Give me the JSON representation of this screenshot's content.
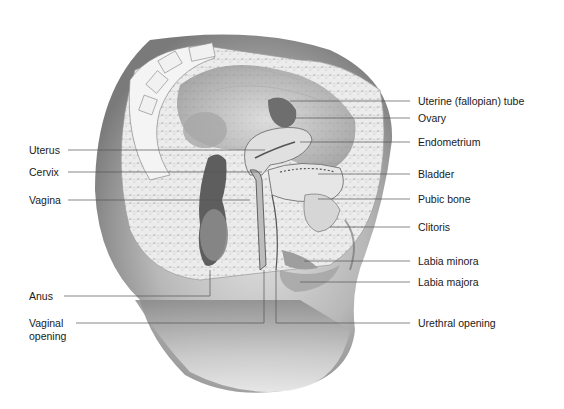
{
  "figure": {
    "type": "anatomical-illustration",
    "colors": {
      "background": "#ffffff",
      "label_text": "#1a1a1a",
      "leader_line": "#555555",
      "skin_dark": "#6f6f6f",
      "skin_light": "#d9d9d9",
      "tissue": "#e8e8e8"
    }
  },
  "labels_left": [
    {
      "id": "uterus",
      "text": "Uterus",
      "y": 150
    },
    {
      "id": "cervix",
      "text": "Cervix",
      "y": 172
    },
    {
      "id": "vagina",
      "text": "Vagina",
      "y": 200
    },
    {
      "id": "anus",
      "text": "Anus",
      "y": 296
    },
    {
      "id": "vaginal-opening",
      "text": "Vaginal opening",
      "line1": "Vaginal",
      "line2": "opening",
      "y": 323
    }
  ],
  "labels_right": [
    {
      "id": "uterine-tube",
      "text": "Uterine (fallopian) tube",
      "y": 101
    },
    {
      "id": "ovary",
      "text": "Ovary",
      "y": 118
    },
    {
      "id": "endometrium",
      "text": "Endometrium",
      "y": 142
    },
    {
      "id": "bladder",
      "text": "Bladder",
      "y": 174
    },
    {
      "id": "pubic-bone",
      "text": "Pubic bone",
      "y": 199
    },
    {
      "id": "clitoris",
      "text": "Clitoris",
      "y": 227
    },
    {
      "id": "labia-minora",
      "text": "Labia minora",
      "y": 261
    },
    {
      "id": "labia-majora",
      "text": "Labia majora",
      "y": 282
    },
    {
      "id": "urethral-opening",
      "text": "Urethral opening",
      "y": 323
    }
  ]
}
